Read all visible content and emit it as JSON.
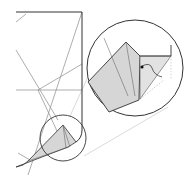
{
  "diagram": {
    "type": "origami-step",
    "colors": {
      "background": "#ffffff",
      "edge": "#333333",
      "crease": "#888888",
      "fill": "#d6d6d6",
      "connector": "#c8c8c8",
      "arrow": "#222222"
    },
    "magnifier_small": {
      "cx": 63,
      "cy": 138,
      "r": 23
    },
    "magnifier_large": {
      "cx": 135,
      "cy": 68,
      "r": 48
    },
    "labels": []
  }
}
